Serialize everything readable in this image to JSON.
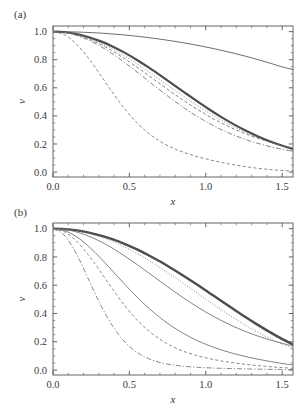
{
  "figure": {
    "label_a": "(a)",
    "label_b": "(b)",
    "background_color": "#ffffff",
    "ink_color": "#3a3a3a"
  },
  "chart_data": [
    {
      "type": "line",
      "panel": "(a)",
      "title": "",
      "xlabel": "x",
      "ylabel": "v",
      "xlim": [
        0.0,
        1.5708
      ],
      "ylim": [
        -0.035,
        1.04
      ],
      "grid": false,
      "legend": "none",
      "xticks": [
        0.0,
        0.5,
        1.0,
        1.5
      ],
      "xtick_labels": [
        "0.0",
        "0.5",
        "1.0",
        "1.5"
      ],
      "yticks": [
        0.0,
        0.2,
        0.4,
        0.6,
        0.8,
        1.0
      ],
      "ytick_labels": [
        "0.0",
        "0.2",
        "0.4",
        "0.6",
        "0.8",
        "1.0"
      ],
      "x": [
        0.0,
        0.0785,
        0.1571,
        0.2356,
        0.3142,
        0.3927,
        0.4712,
        0.5498,
        0.6283,
        0.7069,
        0.7854,
        0.8639,
        0.9425,
        1.021,
        1.0996,
        1.1781,
        1.2566,
        1.3352,
        1.4137,
        1.4923,
        1.5708
      ],
      "series": [
        {
          "name": "shallow-solid",
          "style": "solid",
          "width": 0.8,
          "color": "#4a4a4a",
          "values": [
            1.0,
            0.9993,
            0.9973,
            0.9939,
            0.9892,
            0.9831,
            0.9757,
            0.967,
            0.9569,
            0.9455,
            0.9328,
            0.9186,
            0.903,
            0.886,
            0.8675,
            0.8475,
            0.8259,
            0.8027,
            0.7778,
            0.7513,
            0.7295
          ]
        },
        {
          "name": "thick-bundle-solid",
          "style": "solid",
          "width": 2.2,
          "color": "#4d4d4d",
          "values": [
            1.0,
            0.9955,
            0.9822,
            0.9604,
            0.9304,
            0.8928,
            0.8484,
            0.7982,
            0.7434,
            0.6852,
            0.6251,
            0.5645,
            0.5048,
            0.4473,
            0.3931,
            0.3431,
            0.2978,
            0.2574,
            0.2219,
            0.1911,
            0.1645
          ]
        },
        {
          "name": "bundle-dotted",
          "style": "dotted",
          "width": 0.85,
          "color": "#6a6a6a",
          "values": [
            1.0,
            0.9945,
            0.9784,
            0.9524,
            0.9173,
            0.8744,
            0.8249,
            0.7703,
            0.7122,
            0.6521,
            0.5916,
            0.5321,
            0.4749,
            0.4209,
            0.3709,
            0.3253,
            0.2844,
            0.2479,
            0.2158,
            0.1878,
            0.1635
          ]
        },
        {
          "name": "bundle-dashed",
          "style": "dashed",
          "width": 0.85,
          "color": "#6a6a6a",
          "values": [
            1.0,
            0.9938,
            0.9756,
            0.9463,
            0.9071,
            0.8596,
            0.8055,
            0.7467,
            0.6853,
            0.6231,
            0.5619,
            0.5031,
            0.4479,
            0.3971,
            0.3511,
            0.3101,
            0.2739,
            0.2423,
            0.2148,
            0.1911,
            0.1706
          ]
        },
        {
          "name": "bundle-dashdot",
          "style": "dashdot",
          "width": 0.85,
          "color": "#707070",
          "values": [
            1.0,
            0.9928,
            0.9716,
            0.9378,
            0.8928,
            0.8386,
            0.7776,
            0.7122,
            0.6449,
            0.5779,
            0.5133,
            0.4526,
            0.3971,
            0.3473,
            0.3036,
            0.2658,
            0.2335,
            0.2062,
            0.1833,
            0.1642,
            0.1482
          ]
        },
        {
          "name": "fast-dashed",
          "style": "dashed",
          "width": 0.9,
          "color": "#7a7a7a",
          "values": [
            1.0,
            0.9756,
            0.9071,
            0.8055,
            0.6853,
            0.5619,
            0.4479,
            0.3511,
            0.2739,
            0.2148,
            0.1706,
            0.1374,
            0.1109,
            0.0886,
            0.0695,
            0.0531,
            0.0392,
            0.0277,
            0.0186,
            0.0118,
            0.0073
          ]
        }
      ]
    },
    {
      "type": "line",
      "panel": "(b)",
      "title": "",
      "xlabel": "x",
      "ylabel": "v",
      "xlim": [
        0.0,
        1.5708
      ],
      "ylim": [
        -0.035,
        1.04
      ],
      "grid": false,
      "legend": "none",
      "xticks": [
        0.0,
        0.5,
        1.0,
        1.5
      ],
      "xtick_labels": [
        "0.0",
        "0.5",
        "1.0",
        "1.5"
      ],
      "yticks": [
        0.0,
        0.2,
        0.4,
        0.6,
        0.8,
        1.0
      ],
      "ytick_labels": [
        "0.0",
        "0.2",
        "0.4",
        "0.6",
        "0.8",
        "1.0"
      ],
      "x": [
        0.0,
        0.0785,
        0.1571,
        0.2356,
        0.3142,
        0.3927,
        0.4712,
        0.5498,
        0.6283,
        0.7069,
        0.7854,
        0.8639,
        0.9425,
        1.021,
        1.0996,
        1.1781,
        1.2566,
        1.3352,
        1.4137,
        1.4923,
        1.5708
      ],
      "series": [
        {
          "name": "thick-bundle-solid",
          "style": "solid",
          "width": 2.4,
          "color": "#4d4d4d",
          "values": [
            1.0,
            0.9969,
            0.9877,
            0.9724,
            0.9511,
            0.9239,
            0.8912,
            0.8533,
            0.8106,
            0.7638,
            0.7133,
            0.6599,
            0.6043,
            0.5474,
            0.49,
            0.4329,
            0.377,
            0.3231,
            0.2719,
            0.2241,
            0.1803
          ]
        },
        {
          "name": "bundle-dotted",
          "style": "dotted",
          "width": 0.9,
          "color": "#6a6a6a",
          "values": [
            1.0,
            0.9962,
            0.9849,
            0.9662,
            0.9403,
            0.9076,
            0.8686,
            0.8239,
            0.7743,
            0.7206,
            0.6638,
            0.605,
            0.5452,
            0.4856,
            0.4273,
            0.3714,
            0.3188,
            0.2703,
            0.2264,
            0.1874,
            0.1534
          ]
        },
        {
          "name": "mid-solid",
          "style": "solid",
          "width": 0.85,
          "color": "#6e6e6e",
          "values": [
            1.0,
            0.9938,
            0.9756,
            0.9463,
            0.9071,
            0.8596,
            0.8055,
            0.7467,
            0.6853,
            0.6231,
            0.5619,
            0.5031,
            0.4479,
            0.3971,
            0.3511,
            0.3101,
            0.2739,
            0.2423,
            0.2148,
            0.1911,
            0.1706
          ]
        },
        {
          "name": "steep-solid",
          "style": "solid",
          "width": 0.85,
          "color": "#6e6e6e",
          "values": [
            1.0,
            0.9845,
            0.9403,
            0.8726,
            0.7889,
            0.6972,
            0.6046,
            0.5165,
            0.4362,
            0.3654,
            0.3044,
            0.2527,
            0.2093,
            0.1731,
            0.143,
            0.1177,
            0.0963,
            0.0779,
            0.0619,
            0.0479,
            0.0355
          ]
        },
        {
          "name": "steep-dashed",
          "style": "dashed",
          "width": 0.85,
          "color": "#757575",
          "values": [
            1.0,
            0.9759,
            0.9085,
            0.8087,
            0.6903,
            0.5679,
            0.4536,
            0.3551,
            0.2751,
            0.2125,
            0.1648,
            0.1289,
            0.1018,
            0.0811,
            0.0648,
            0.0518,
            0.0411,
            0.0321,
            0.0245,
            0.0178,
            0.0119
          ]
        },
        {
          "name": "fastest-dashdot",
          "style": "dashdot",
          "width": 0.9,
          "color": "#7d7d7d",
          "values": [
            1.0,
            0.9483,
            0.8146,
            0.6342,
            0.4554,
            0.3066,
            0.1977,
            0.1249,
            0.0792,
            0.0519,
            0.0357,
            0.0259,
            0.0196,
            0.0154,
            0.0124,
            0.0101,
            0.0082,
            0.0066,
            0.0051,
            0.0038,
            0.0025
          ]
        }
      ]
    }
  ]
}
